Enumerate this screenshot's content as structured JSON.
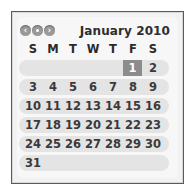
{
  "calendar": {
    "title": "January 2010",
    "nav": {
      "back_label": "‹",
      "today_label": "",
      "forward_label": "›"
    },
    "weekdays": [
      "S",
      "M",
      "T",
      "W",
      "T",
      "F",
      "S"
    ],
    "weeks": [
      [
        "",
        "",
        "",
        "",
        "",
        "1",
        "2"
      ],
      [
        "3",
        "4",
        "5",
        "6",
        "7",
        "8",
        "9"
      ],
      [
        "10",
        "11",
        "12",
        "13",
        "14",
        "15",
        "16"
      ],
      [
        "17",
        "18",
        "19",
        "20",
        "21",
        "22",
        "23"
      ],
      [
        "24",
        "25",
        "26",
        "27",
        "28",
        "29",
        "30"
      ],
      [
        "31",
        "",
        "",
        "",
        "",
        "",
        ""
      ]
    ],
    "highlighted_day": "1",
    "colors": {
      "border": "#5a5a5a",
      "week_band": "#e4e4e4",
      "highlight": "#8c8c8c",
      "nav_button": "#9a9a9a"
    }
  }
}
